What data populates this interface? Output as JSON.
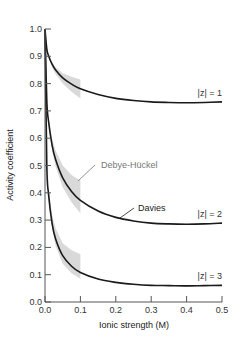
{
  "chart_data": {
    "type": "line",
    "title": "",
    "xlabel": "Ionic strength (M)",
    "ylabel": "Activity coefficient",
    "xlim": [
      0,
      0.5
    ],
    "ylim": [
      0,
      1.0
    ],
    "xticks": [
      "0.0",
      "0.1",
      "0.2",
      "0.3",
      "0.4",
      "0.5"
    ],
    "yticks": [
      "0.0",
      "0.1",
      "0.2",
      "0.3",
      "0.4",
      "0.5",
      "0.6",
      "0.7",
      "0.8",
      "0.9",
      "1.0"
    ],
    "grid": false,
    "x": [
      0,
      0.005,
      0.01,
      0.02,
      0.03,
      0.05,
      0.075,
      0.1,
      0.15,
      0.2,
      0.25,
      0.3,
      0.35,
      0.4,
      0.45,
      0.5
    ],
    "series": [
      {
        "name": "Davies |z| = 1",
        "label": "|z| = 1",
        "values": [
          1.0,
          0.927,
          0.902,
          0.871,
          0.85,
          0.821,
          0.798,
          0.781,
          0.76,
          0.746,
          0.738,
          0.733,
          0.731,
          0.73,
          0.731,
          0.733
        ]
      },
      {
        "name": "Davies |z| = 2",
        "label": "|z| = 2",
        "values": [
          1.0,
          0.739,
          0.662,
          0.575,
          0.522,
          0.455,
          0.405,
          0.372,
          0.333,
          0.31,
          0.297,
          0.289,
          0.286,
          0.285,
          0.286,
          0.289
        ]
      },
      {
        "name": "Davies |z| = 3",
        "label": "|z| = 3",
        "values": [
          1.0,
          0.506,
          0.395,
          0.288,
          0.231,
          0.17,
          0.131,
          0.108,
          0.084,
          0.072,
          0.065,
          0.061,
          0.06,
          0.059,
          0.06,
          0.061
        ]
      }
    ],
    "debye_huckel_band": {
      "label": "Debye-Hückel",
      "x": [
        0,
        0.01,
        0.02,
        0.03,
        0.05,
        0.075,
        0.1
      ],
      "bands": [
        {
          "z": 1,
          "lower": [
            1.0,
            0.895,
            0.86,
            0.835,
            0.8,
            0.77,
            0.745
          ],
          "upper": [
            1.0,
            0.905,
            0.878,
            0.86,
            0.838,
            0.825,
            0.815
          ]
        },
        {
          "z": 2,
          "lower": [
            1.0,
            0.65,
            0.555,
            0.495,
            0.42,
            0.365,
            0.325
          ],
          "upper": [
            1.0,
            0.675,
            0.6,
            0.555,
            0.5,
            0.465,
            0.445
          ]
        },
        {
          "z": 3,
          "lower": [
            1.0,
            0.38,
            0.27,
            0.205,
            0.14,
            0.105,
            0.085
          ],
          "upper": [
            1.0,
            0.415,
            0.32,
            0.27,
            0.215,
            0.19,
            0.175
          ]
        }
      ]
    },
    "annotations": {
      "debye_huckel": "Debye-Hückel",
      "davies": "Davies"
    },
    "colors": {
      "curve": "#1a1a1a",
      "band": "#d9d9d9",
      "debye_label": "#777777",
      "axis": "#555555"
    }
  }
}
